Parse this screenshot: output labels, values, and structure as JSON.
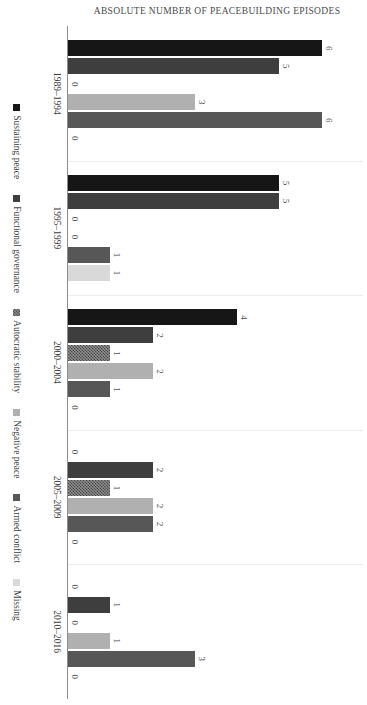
{
  "chart_data": {
    "type": "bar",
    "title": "",
    "subtitle": "",
    "xlabel": "",
    "ylabel": "ABSOLUTE NUMBER OF PEACEBUILDING EPISODES",
    "orientation": "vertical-grouped-rotated",
    "grid": "group-separators-only",
    "legend_position": "bottom",
    "ylim": [
      0,
      7
    ],
    "categories": [
      "1989–1994",
      "1995–1999",
      "2000–2004",
      "2005–2009",
      "2010–2016"
    ],
    "series": [
      {
        "name": "Sustaining peace",
        "color": "#161616",
        "pattern": "solid",
        "values": [
          6,
          5,
          4,
          0,
          0
        ]
      },
      {
        "name": "Functional governance",
        "color": "#3e3e3e",
        "pattern": "solid",
        "values": [
          5,
          5,
          2,
          2,
          1
        ]
      },
      {
        "name": "Autocratic stability",
        "color": "#8c8c8c",
        "pattern": "checker",
        "values": [
          0,
          0,
          1,
          1,
          0
        ]
      },
      {
        "name": "Negative peace",
        "color": "#575757",
        "pattern": "solid",
        "values": [
          3,
          0,
          2,
          2,
          1
        ]
      },
      {
        "name": "Armed conflict",
        "color": "#b0b0b0",
        "pattern": "solid",
        "values": [
          6,
          1,
          1,
          2,
          3
        ]
      },
      {
        "name": "Missing",
        "color": "#d9d9d9",
        "pattern": "solid",
        "values": [
          0,
          1,
          0,
          0,
          0
        ]
      }
    ],
    "value_labels": [
      [
        6,
        5,
        0,
        3,
        6,
        0
      ],
      [
        5,
        5,
        0,
        0,
        1,
        1
      ],
      [
        4,
        2,
        1,
        2,
        1,
        0
      ],
      [
        0,
        2,
        1,
        2,
        2,
        0
      ],
      [
        0,
        1,
        0,
        1,
        3,
        0
      ]
    ]
  },
  "legend": {
    "items": [
      {
        "label": "Sustaining peace"
      },
      {
        "label": "Functional governance"
      },
      {
        "label": "Autocratic stability"
      },
      {
        "label": "Negative peace"
      },
      {
        "label": "Armed conflict"
      },
      {
        "label": "Missing"
      }
    ]
  }
}
